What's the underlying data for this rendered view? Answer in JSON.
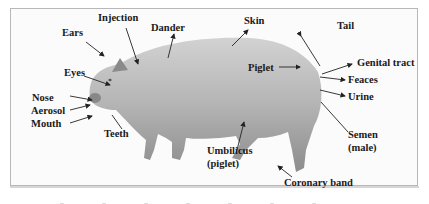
{
  "figure": {
    "subject": "pig",
    "colors": {
      "background": "#fbfbfb",
      "frame": "#b8b8b8",
      "label_text": "#1a1a1a",
      "arrow": "#222222",
      "pig_body": "#a9a9a9"
    },
    "labels": [
      {
        "id": "injection",
        "text": "Injection"
      },
      {
        "id": "ears",
        "text": "Ears"
      },
      {
        "id": "dander",
        "text": "Dander"
      },
      {
        "id": "skin",
        "text": "Skin"
      },
      {
        "id": "tail",
        "text": "Tail"
      },
      {
        "id": "eyes",
        "text": "Eyes"
      },
      {
        "id": "piglet",
        "text": "Piglet"
      },
      {
        "id": "genital-tract",
        "text": "Genital tract"
      },
      {
        "id": "feaces",
        "text": "Feaces"
      },
      {
        "id": "nose",
        "text": "Nose"
      },
      {
        "id": "urine",
        "text": "Urine"
      },
      {
        "id": "aerosol",
        "text": "Aerosol"
      },
      {
        "id": "mouth",
        "text": "Mouth"
      },
      {
        "id": "teeth",
        "text": "Teeth"
      },
      {
        "id": "semen",
        "text": "Semen"
      },
      {
        "id": "semen-note",
        "text": "(male)"
      },
      {
        "id": "umbilicus",
        "text": "Umbilicus"
      },
      {
        "id": "umbilicus-note",
        "text": "(piglet)"
      },
      {
        "id": "coronary-band",
        "text": "Coronary band"
      }
    ]
  }
}
